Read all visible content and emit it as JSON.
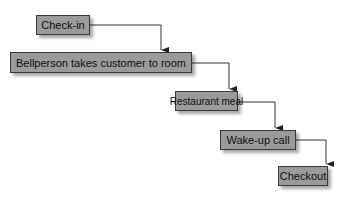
{
  "diagram": {
    "type": "sequential-flow",
    "steps": [
      {
        "label": "Check-in"
      },
      {
        "label": "Bellperson takes customer to room"
      },
      {
        "label": "Restaurant meal"
      },
      {
        "label": "Wake-up call"
      },
      {
        "label": "Checkout"
      }
    ],
    "colors": {
      "box_fill": "#9a9a9a",
      "border": "#3a3a3a",
      "arrow": "#222222"
    }
  }
}
